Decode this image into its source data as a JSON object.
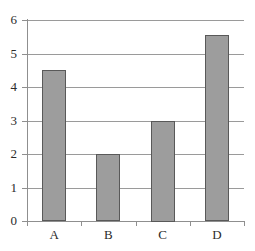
{
  "chart_data": {
    "type": "bar",
    "title": "",
    "subtitle": "",
    "xlabel": "",
    "ylabel": "",
    "categories": [
      "A",
      "B",
      "C",
      "D"
    ],
    "values": [
      4.5,
      2,
      3,
      5.55
    ],
    "ylim": [
      0,
      6
    ],
    "y_ticks": [
      0,
      1,
      2,
      3,
      4,
      5,
      6
    ],
    "y_tick_labels": [
      "0",
      "1",
      "2",
      "3",
      "4",
      "5",
      "6"
    ],
    "x_tick_labels": [
      "A",
      "B",
      "C",
      "D"
    ],
    "grid": true,
    "grid_axis": "y",
    "legend": false,
    "legend_position": "none",
    "bar_fill_color": "#9d9d9d",
    "bar_border_color": "#595959",
    "gridline_color": "#9a9a9a",
    "axis_color": "#8f8f8f",
    "background_color": "#ffffff"
  }
}
